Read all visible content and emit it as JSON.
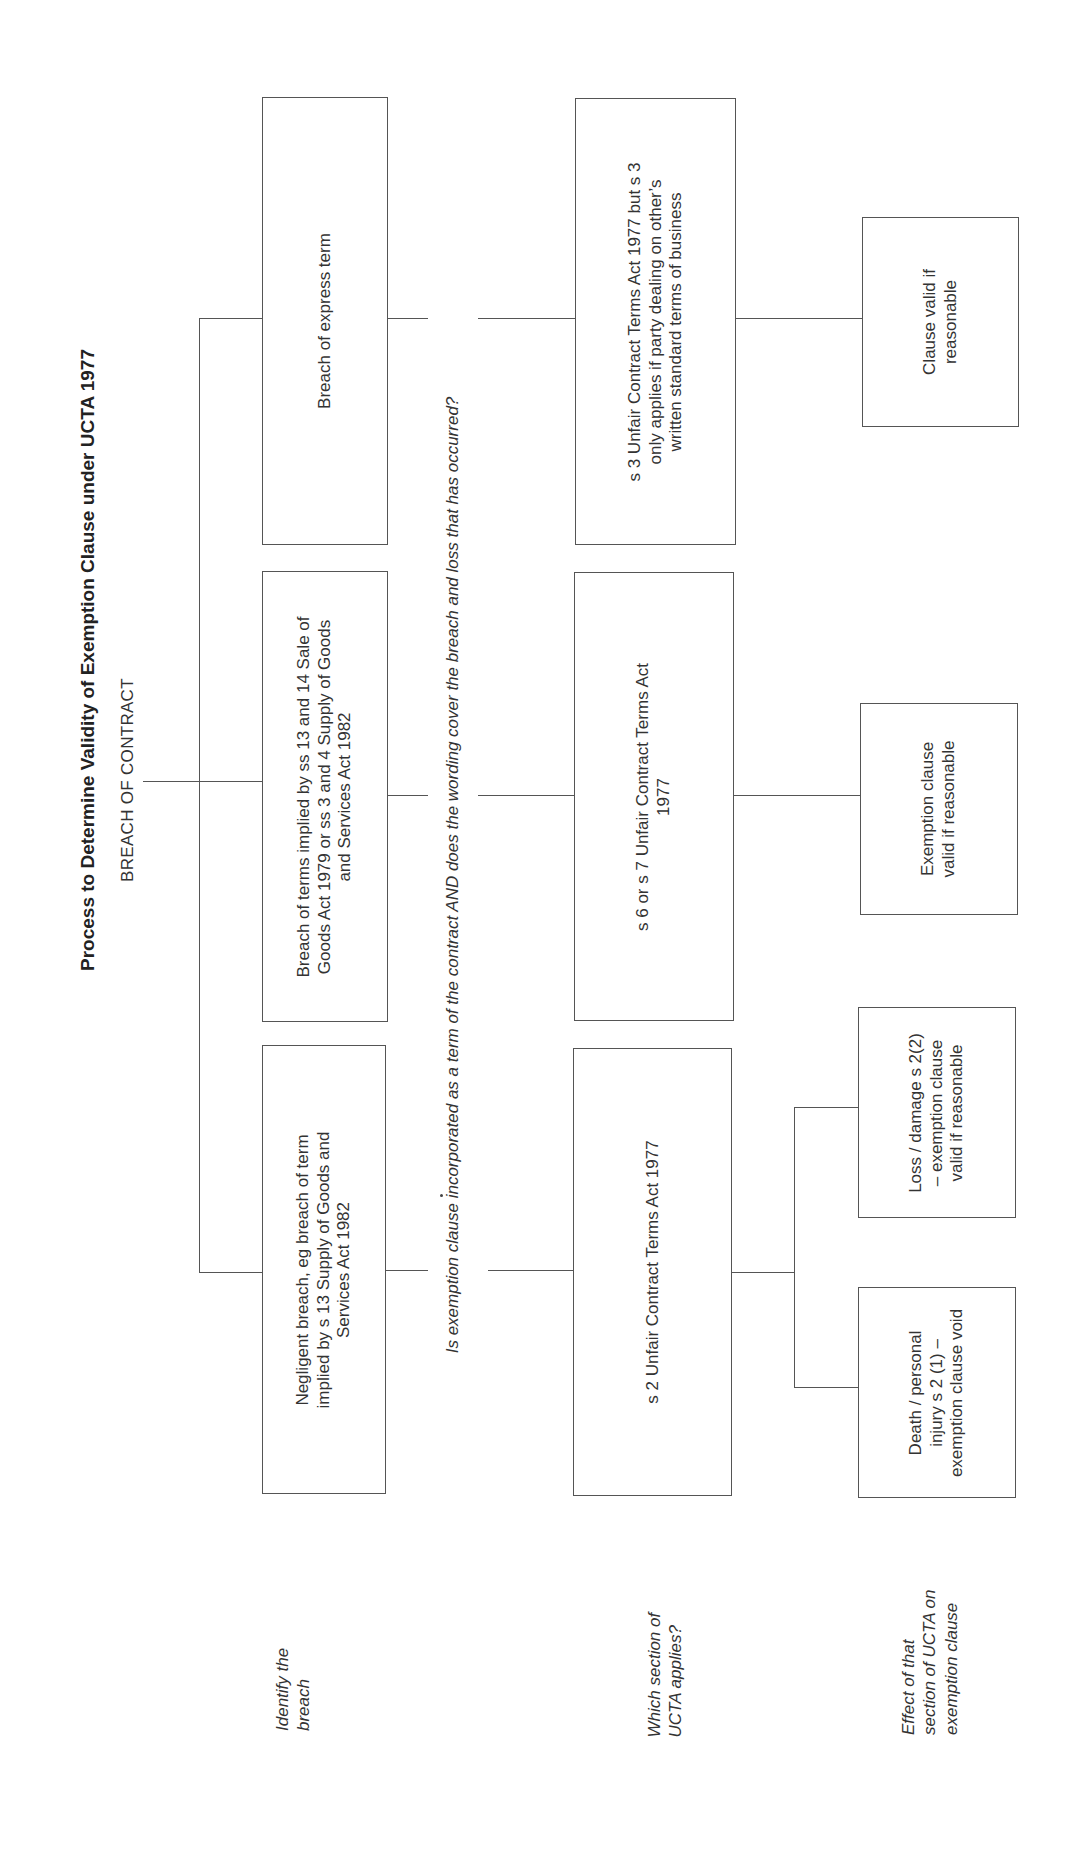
{
  "header": {
    "title": "Process to Determine Validity of Exemption Clause under UCTA 1977",
    "root": "BREACH OF CONTRACT"
  },
  "question": "Is exemption clause incorporated as a term of the contract AND does the wording cover the breach and loss that has occurred?",
  "row_labels": {
    "identify": "Identify the breach",
    "which_section": "Which section of UCTA applies?",
    "effect": "Effect of that section of UCTA on exemption clause"
  },
  "breaches": {
    "negligent": "Negligent breach, eg breach of term implied by s 13 Supply of Goods and Services Act 1982",
    "implied": "Breach of terms implied by  ss 13 and 14 Sale of Goods Act 1979 or ss 3 and 4 Supply of Goods and Services Act 1982",
    "express": "Breach of express term"
  },
  "sections": {
    "s2": "s 2 Unfair Contract Terms Act 1977",
    "s6_s7": "s 6 or s 7 Unfair Contract Terms Act 1977",
    "s3": "s 3 Unfair Contract Terms Act 1977 but s 3 only applies if party dealing on other’s written standard terms of business"
  },
  "effects": {
    "death": "Death / personal injury s  2 (1) – exemption clause void",
    "loss": "Loss / damage s 2(2) – exemption clause valid if reasonable",
    "exemption_valid": "Exemption clause valid if reasonable",
    "clause_valid": "Clause valid if reasonable"
  },
  "colors": {
    "line": "#555555",
    "text": "#333333",
    "background": "#ffffff"
  }
}
